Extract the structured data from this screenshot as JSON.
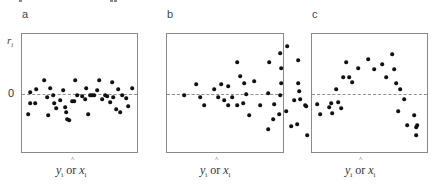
{
  "chart_data": [
    {
      "type": "scatter",
      "panel_label": "a",
      "title": "",
      "xlabel": "ŷi or xi",
      "ylabel": "ri",
      "zero_tick": "0",
      "reference_line": {
        "y": 0,
        "style": "dashed"
      },
      "grid": false,
      "pattern": "random scatter, constant variance",
      "points_px": [
        [
          6,
          -20
        ],
        [
          8,
          2
        ],
        [
          13,
          -9
        ],
        [
          14,
          5
        ],
        [
          22,
          14
        ],
        [
          25,
          -3
        ],
        [
          26,
          -21
        ],
        [
          28,
          6
        ],
        [
          31,
          -1
        ],
        [
          32,
          -9
        ],
        [
          38,
          -6
        ],
        [
          41,
          4
        ],
        [
          43,
          -13
        ],
        [
          44,
          -18
        ],
        [
          45,
          -25
        ],
        [
          50,
          -7
        ],
        [
          52,
          -7
        ],
        [
          53,
          14
        ],
        [
          55,
          -1
        ],
        [
          60,
          -2
        ],
        [
          63,
          -5
        ],
        [
          64,
          6
        ],
        [
          68,
          -1
        ],
        [
          70,
          -1
        ],
        [
          72,
          -1
        ],
        [
          75,
          4
        ],
        [
          77,
          14
        ],
        [
          80,
          -5
        ],
        [
          83,
          -1
        ],
        [
          85,
          -2
        ],
        [
          88,
          -8
        ],
        [
          91,
          -3
        ],
        [
          94,
          -15
        ],
        [
          96,
          5
        ],
        [
          98,
          -18
        ],
        [
          100,
          -1
        ],
        [
          104,
          -4
        ],
        [
          106,
          -12
        ],
        [
          110,
          6
        ],
        [
          8,
          -9
        ],
        [
          34,
          -14
        ],
        [
          47,
          -26
        ],
        [
          66,
          -20
        ],
        [
          90,
          12
        ]
      ]
    },
    {
      "type": "scatter",
      "panel_label": "b",
      "title": "",
      "xlabel": "ŷi or xi",
      "ylabel": "",
      "reference_line": {
        "y": 0,
        "style": "dashed"
      },
      "grid": false,
      "pattern": "funnel — variance increases with fitted value",
      "points_px": [
        [
          17,
          -1
        ],
        [
          29,
          10
        ],
        [
          33,
          -3
        ],
        [
          37,
          -11
        ],
        [
          47,
          5
        ],
        [
          51,
          -3
        ],
        [
          54,
          10
        ],
        [
          57,
          -6
        ],
        [
          61,
          -11
        ],
        [
          61,
          8
        ],
        [
          65,
          -3
        ],
        [
          70,
          -11
        ],
        [
          70,
          32
        ],
        [
          73,
          18
        ],
        [
          76,
          -9
        ],
        [
          77,
          11
        ],
        [
          79,
          0
        ],
        [
          82,
          -21
        ],
        [
          87,
          13
        ],
        [
          93,
          -11
        ],
        [
          101,
          1
        ],
        [
          101,
          -35
        ],
        [
          102,
          32
        ],
        [
          106,
          -25
        ],
        [
          107,
          -10
        ],
        [
          112,
          -20
        ],
        [
          113,
          -1
        ],
        [
          113,
          41
        ],
        [
          114,
          26
        ],
        [
          114,
          11
        ],
        [
          119,
          -17
        ],
        [
          120,
          48
        ],
        [
          124,
          -32
        ],
        [
          127,
          -6
        ],
        [
          130,
          -30
        ],
        [
          131,
          34
        ],
        [
          131,
          11
        ],
        [
          132,
          3
        ],
        [
          133,
          -5
        ],
        [
          138,
          -11
        ],
        [
          139,
          -12
        ],
        [
          140,
          -41
        ]
      ]
    },
    {
      "type": "scatter",
      "panel_label": "c",
      "title": "",
      "xlabel": "ŷi or xi",
      "ylabel": "",
      "reference_line": {
        "y": 0,
        "style": "dashed"
      },
      "grid": false,
      "pattern": "curvilinear — inverted U shape",
      "points_px": [
        [
          5,
          -10
        ],
        [
          8,
          -20
        ],
        [
          17,
          -13
        ],
        [
          19,
          -9
        ],
        [
          20,
          -19
        ],
        [
          24,
          5
        ],
        [
          26,
          -8
        ],
        [
          29,
          -14
        ],
        [
          31,
          17
        ],
        [
          34,
          32
        ],
        [
          37,
          17
        ],
        [
          40,
          12
        ],
        [
          46,
          26
        ],
        [
          56,
          35
        ],
        [
          62,
          25
        ],
        [
          70,
          30
        ],
        [
          74,
          17
        ],
        [
          80,
          40
        ],
        [
          82,
          25
        ],
        [
          84,
          11
        ],
        [
          88,
          5
        ],
        [
          92,
          -5
        ],
        [
          86,
          -17
        ],
        [
          95,
          -31
        ],
        [
          102,
          -21
        ],
        [
          104,
          -33
        ],
        [
          105,
          -31
        ],
        [
          104,
          -41
        ]
      ]
    }
  ],
  "panels": [
    {
      "letter": "a",
      "x_label_main": "ŷi or xi"
    },
    {
      "letter": "b",
      "x_label_main": "ŷi or xi"
    },
    {
      "letter": "c",
      "x_label_main": "ŷi or xi"
    }
  ],
  "axis": {
    "y_label": "r",
    "y_label_sub": "i",
    "zero_tick": "0",
    "x_var1": "y",
    "x_var1_sub": "i",
    "x_connector": " or ",
    "x_var2": "x",
    "x_var2_sub": "i",
    "hat": "^"
  },
  "colors": {
    "dot": "#111111",
    "frame": "#8a8a8a",
    "dashed": "#8f8f8f"
  }
}
